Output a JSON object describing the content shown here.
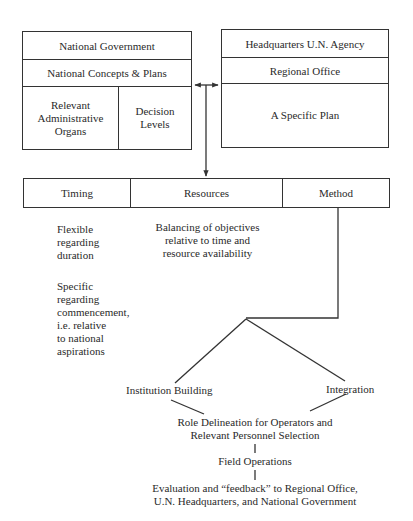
{
  "left_box": {
    "title": "National Government",
    "subtitle": "National Concepts & Plans",
    "cells": [
      {
        "label": "Relevant\nAdministrative\nOrgans"
      },
      {
        "label": "Decision\nLevels"
      }
    ]
  },
  "right_box": {
    "title": "Headquarters U.N. Agency",
    "subtitle": "Regional Office",
    "body": "A Specific Plan"
  },
  "header_row": {
    "columns": [
      {
        "label": "Timing"
      },
      {
        "label": "Resources"
      },
      {
        "label": "Method"
      }
    ]
  },
  "timing_notes": {
    "flexible": "Flexible\nregarding\nduration",
    "specific": "Specific\nregarding\ncommencement,\ni.e. relative\nto national\naspirations"
  },
  "resources_note": "Balancing of objectives\nrelative to time and\nresource availability",
  "method_branches": {
    "left": "Institution Building",
    "right": "Integration"
  },
  "flow": {
    "role": "Role Delineation for Operators and\nRelevant Personnel Selection",
    "field": "Field Operations",
    "evaluation": "Evaluation and “feedback” to Regional Office,\nU.N. Headquarters, and National Government"
  },
  "colors": {
    "line": "#333333",
    "text": "#2a2a2a",
    "background": "#ffffff"
  }
}
